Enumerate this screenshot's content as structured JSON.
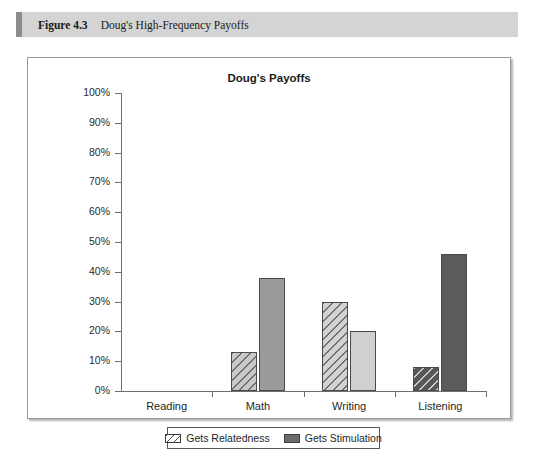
{
  "figure": {
    "label": "Figure 4.3",
    "title": "Doug's High-Frequency Payoffs"
  },
  "chart_data": {
    "type": "bar",
    "title": "Doug's Payoffs",
    "xlabel": "",
    "ylabel": "",
    "ylim": [
      0,
      100
    ],
    "ytick_labels": [
      "100%",
      "90%",
      "80%",
      "70%",
      "60%",
      "50%",
      "40%",
      "30%",
      "20%",
      "10%",
      "0%"
    ],
    "ytick_values": [
      100,
      90,
      80,
      70,
      60,
      50,
      40,
      30,
      20,
      10,
      0
    ],
    "grid": false,
    "legend_position": "bottom",
    "categories": [
      "Reading",
      "Math",
      "Writing",
      "Listening"
    ],
    "series": [
      {
        "name": "Gets Relatedness",
        "style": "hatched",
        "values": [
          0,
          13,
          30,
          8
        ],
        "colors": [
          "#c8c8c8",
          "#c8c8c8",
          "#d2d2d2",
          "#585858"
        ]
      },
      {
        "name": "Gets Stimulation",
        "style": "solid",
        "values": [
          0,
          38,
          20,
          46
        ],
        "colors": [
          "#9a9a9a",
          "#9a9a9a",
          "#d0d0d0",
          "#5b5b5b"
        ]
      }
    ]
  },
  "legend": {
    "items": [
      {
        "label": "Gets Relatedness",
        "swatch": "hatched-swatch"
      },
      {
        "label": "Gets Stimulation",
        "swatch": "solid-swatch"
      }
    ]
  }
}
